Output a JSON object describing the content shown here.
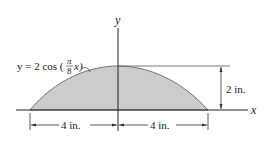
{
  "figure": {
    "equation_prefix": "y = 2 cos (",
    "equation_frac_num": "π",
    "equation_frac_den": "8",
    "equation_suffix": "x)",
    "y_axis_label": "y",
    "x_axis_label": "x",
    "height_dim": "2 in.",
    "left_dim": "4 in.",
    "right_dim": "4 in.",
    "fill_color": "#cccccc",
    "line_color": "#222222"
  }
}
